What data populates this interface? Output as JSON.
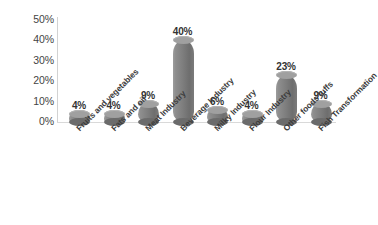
{
  "chart_data": {
    "type": "bar",
    "title": "",
    "subtitle": "",
    "xlabel": "",
    "ylabel": "",
    "ylim": [
      0,
      50
    ],
    "yticks": [
      "0%",
      "10%",
      "20%",
      "30%",
      "40%",
      "50%"
    ],
    "ytick_values": [
      0,
      10,
      20,
      30,
      40,
      50
    ],
    "grid": false,
    "legend": "none",
    "bar_style": "3d-cylinder",
    "bar_color": "#7d7d7d",
    "background_color": "#ffffff",
    "categories": [
      "Fruits and vegetables",
      "Fats and oil",
      "Meat Industry",
      "Beverage Industry",
      "Milky Industry",
      "Flour Industry",
      "Other foods tuffs",
      "Fish Transformation"
    ],
    "values": [
      4,
      4,
      9,
      40,
      6,
      4,
      23,
      9
    ],
    "data_labels": [
      "4%",
      "4%",
      "9%",
      "40%",
      "6%",
      "4%",
      "23%",
      "9%"
    ]
  }
}
